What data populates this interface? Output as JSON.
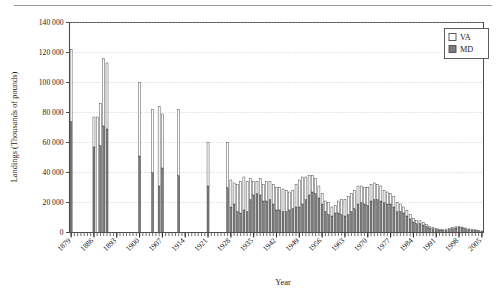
{
  "figure": {
    "has_top_rule": true,
    "background": "#ffffff",
    "frame_color": "#4d4d4d",
    "gridline_color": "#b8b8b8"
  },
  "legend": {
    "position": "top-right-inside",
    "entries": [
      {
        "label": "VA",
        "swatch": "#ffffff",
        "swatch_border": "#4d4d4d"
      },
      {
        "label": "MD",
        "swatch": "#7d7d7d",
        "swatch_border": "#4d4d4d"
      }
    ]
  },
  "chart_data": {
    "type": "bar",
    "subtype": "stacked",
    "title": "",
    "xlabel": "Year",
    "ylabel": "Landings (Thousands of pounds)",
    "ylim": [
      0,
      140000
    ],
    "ytick_values": [
      0,
      20000,
      40000,
      60000,
      80000,
      100000,
      120000,
      140000
    ],
    "ytick_labels": [
      "0",
      "20 000",
      "40 000",
      "60 000",
      "80 000",
      "100 000",
      "120 000",
      "140 000"
    ],
    "xlim": [
      1878,
      2007
    ],
    "xtick_labels": [
      "1879",
      "1886",
      "1893",
      "1900",
      "1907",
      "1914",
      "1921",
      "1928",
      "1935",
      "1942",
      "1949",
      "1956",
      "1963",
      "1970",
      "1977",
      "1984",
      "1991",
      "1998",
      "2005"
    ],
    "xtick_label_rotation": -45,
    "xtick_label_interval_years": 7,
    "minor_ticks": "every year",
    "grid": "horizontal dotted",
    "legend_position": "upper right",
    "colors": {
      "VA": "#ffffff",
      "MD": "#7d7d7d"
    },
    "series": [
      {
        "name": "MD",
        "stack_order": 1
      },
      {
        "name": "VA",
        "stack_order": 2
      }
    ],
    "years": [
      1879,
      1880,
      1881,
      1882,
      1883,
      1884,
      1885,
      1886,
      1887,
      1888,
      1889,
      1890,
      1891,
      1892,
      1893,
      1894,
      1895,
      1896,
      1897,
      1898,
      1899,
      1900,
      1901,
      1902,
      1903,
      1904,
      1905,
      1906,
      1907,
      1908,
      1909,
      1910,
      1911,
      1912,
      1913,
      1914,
      1915,
      1916,
      1917,
      1918,
      1919,
      1920,
      1921,
      1922,
      1923,
      1924,
      1925,
      1926,
      1927,
      1928,
      1929,
      1930,
      1931,
      1932,
      1933,
      1934,
      1935,
      1936,
      1937,
      1938,
      1939,
      1940,
      1941,
      1942,
      1943,
      1944,
      1945,
      1946,
      1947,
      1948,
      1949,
      1950,
      1951,
      1952,
      1953,
      1954,
      1955,
      1956,
      1957,
      1958,
      1959,
      1960,
      1961,
      1962,
      1963,
      1964,
      1965,
      1966,
      1967,
      1968,
      1969,
      1970,
      1971,
      1972,
      1973,
      1974,
      1975,
      1976,
      1977,
      1978,
      1979,
      1980,
      1981,
      1982,
      1983,
      1984,
      1985,
      1986,
      1987,
      1988,
      1989,
      1990,
      1991,
      1992,
      1993,
      1994,
      1995,
      1996,
      1997,
      1998,
      1999,
      2000,
      2001,
      2002,
      2003,
      2004,
      2005
    ],
    "values_MD": [
      74000,
      null,
      null,
      null,
      null,
      null,
      null,
      57000,
      0,
      58000,
      71000,
      69000,
      null,
      null,
      null,
      null,
      null,
      null,
      null,
      null,
      null,
      51000,
      null,
      null,
      null,
      40000,
      null,
      31000,
      43000,
      null,
      null,
      null,
      null,
      38000,
      null,
      null,
      null,
      null,
      null,
      null,
      null,
      null,
      31000,
      null,
      null,
      null,
      null,
      null,
      30000,
      17000,
      19000,
      14000,
      13000,
      15000,
      14000,
      22000,
      25000,
      26000,
      25000,
      21000,
      21000,
      22000,
      19000,
      15000,
      15000,
      14000,
      14000,
      15000,
      16000,
      17000,
      17000,
      19000,
      22000,
      25000,
      27000,
      26000,
      23000,
      19000,
      14000,
      12000,
      11000,
      13000,
      13000,
      12000,
      11000,
      12000,
      14000,
      16000,
      19000,
      20000,
      19000,
      18000,
      21000,
      22000,
      22000,
      21000,
      20000,
      19000,
      19000,
      17000,
      14000,
      14000,
      13000,
      11000,
      9000,
      7000,
      6000,
      6000,
      5000,
      4000,
      3000,
      2500,
      2000,
      1500,
      1500,
      1500,
      2000,
      2500,
      3000,
      3500,
      3000,
      2500,
      2000,
      1500,
      1500,
      1200,
      1000,
      900
    ],
    "values_VA": [
      48000,
      null,
      null,
      null,
      null,
      null,
      null,
      20000,
      77000,
      28000,
      45000,
      44000,
      null,
      null,
      null,
      null,
      null,
      null,
      null,
      null,
      null,
      49000,
      null,
      null,
      null,
      42000,
      null,
      53000,
      36000,
      null,
      null,
      null,
      null,
      44000,
      null,
      null,
      null,
      null,
      null,
      null,
      null,
      null,
      29000,
      null,
      null,
      null,
      null,
      null,
      30000,
      18000,
      14000,
      18000,
      21000,
      22000,
      20000,
      14000,
      9000,
      8000,
      11000,
      11000,
      13000,
      12000,
      13000,
      15000,
      15000,
      15000,
      14000,
      12000,
      12000,
      15000,
      18000,
      18000,
      15000,
      13000,
      11000,
      10000,
      8000,
      7000,
      7000,
      8000,
      6000,
      5000,
      8000,
      10000,
      11000,
      12000,
      12000,
      12000,
      12000,
      11000,
      11000,
      12000,
      11000,
      11000,
      10000,
      10000,
      8000,
      8000,
      7000,
      7000,
      6000,
      5000,
      4000,
      3500,
      3000,
      2500,
      2000,
      1800,
      1500,
      1200,
      1000,
      800,
      700,
      700,
      700,
      800,
      900,
      900,
      800,
      700,
      600,
      500,
      400,
      350,
      300,
      250
    ]
  }
}
